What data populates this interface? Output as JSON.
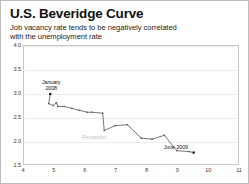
{
  "header": {
    "title": "U.S. Beveridge Curve",
    "subtitle_line1": "Job vacancy rate tends to be negatively correlated",
    "subtitle_line2": "with the unemployment rate"
  },
  "annotations": {
    "start_line1": "January",
    "start_line2": "2008",
    "recession": "Recession",
    "end": "June 2009"
  },
  "chart_data": {
    "type": "scatter",
    "title": "U.S. Beveridge Curve",
    "subtitle": "Job vacancy rate tends to be negatively correlated with the unemployment rate",
    "xlabel": "",
    "ylabel": "",
    "xlim": [
      4,
      11
    ],
    "ylim": [
      1.5,
      4.0
    ],
    "xticks": [
      "4",
      "5",
      "6",
      "7",
      "8",
      "9",
      "10",
      "11"
    ],
    "yticks": [
      "4.0",
      "3.5",
      "3.0",
      "2.5",
      "2.0",
      "1.5"
    ],
    "grid": "horizontal",
    "legend": "none",
    "connected": true,
    "marker": "square",
    "series": [
      {
        "name": "Job vacancy rate vs unemployment rate",
        "color": "#3b3b3b",
        "points": [
          {
            "x": 4.85,
            "y": 3.0,
            "label": "January 2008"
          },
          {
            "x": 4.8,
            "y": 2.8
          },
          {
            "x": 4.95,
            "y": 2.76
          },
          {
            "x": 5.05,
            "y": 2.82
          },
          {
            "x": 5.1,
            "y": 2.74
          },
          {
            "x": 5.3,
            "y": 2.74
          },
          {
            "x": 5.55,
            "y": 2.7
          },
          {
            "x": 5.8,
            "y": 2.66
          },
          {
            "x": 6.05,
            "y": 2.62
          },
          {
            "x": 6.2,
            "y": 2.62
          },
          {
            "x": 6.55,
            "y": 2.6
          },
          {
            "x": 6.6,
            "y": 2.24
          },
          {
            "x": 6.95,
            "y": 2.34
          },
          {
            "x": 7.35,
            "y": 2.36
          },
          {
            "x": 7.8,
            "y": 2.08
          },
          {
            "x": 8.15,
            "y": 2.06
          },
          {
            "x": 8.55,
            "y": 2.14
          },
          {
            "x": 8.95,
            "y": 1.82
          },
          {
            "x": 9.35,
            "y": 1.8
          },
          {
            "x": 9.5,
            "y": 1.78,
            "label": "June 2009"
          }
        ]
      }
    ]
  }
}
